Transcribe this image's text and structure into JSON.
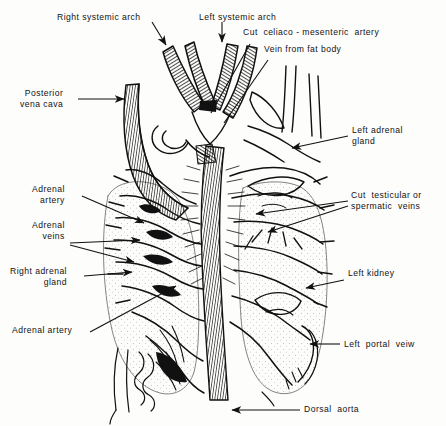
{
  "figure": {
    "kind": "anatomical-line-drawing",
    "style": "pen-and-ink hatched illustration, black on white",
    "ink_color": "#111111",
    "background_color": "#fdfdfc"
  },
  "labels": [
    {
      "id": "right-systemic-arch",
      "text": "Right systemic arch"
    },
    {
      "id": "left-systemic-arch",
      "text": "Left systemic arch"
    },
    {
      "id": "cut-celiaco-mesenteric",
      "text": "Cut  celiaco - mesenteric  artery"
    },
    {
      "id": "vein-from-fat-body",
      "text": "Vein from fat body"
    },
    {
      "id": "posterior-vena-cava",
      "text": "Posterior\nvena cava"
    },
    {
      "id": "left-adrenal-gland",
      "text": "Left adrenal\ngland"
    },
    {
      "id": "adrenal-artery-upper",
      "text": "Adrenal\nartery"
    },
    {
      "id": "adrenal-veins",
      "text": "Adrenal\nveins"
    },
    {
      "id": "cut-testicular-veins",
      "text": "Cut  testicular or\nspermatic  veins"
    },
    {
      "id": "right-adrenal-gland",
      "text": "Right adrenal\ngland"
    },
    {
      "id": "left-kidney",
      "text": "Left kidney"
    },
    {
      "id": "adrenal-artery-lower",
      "text": "Adrenal artery"
    },
    {
      "id": "left-portal-vein",
      "text": "Left  portal  veiw"
    },
    {
      "id": "dorsal-aorta",
      "text": "Dorsal  aorta"
    }
  ]
}
